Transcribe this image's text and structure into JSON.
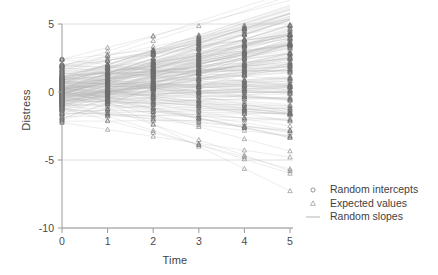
{
  "chart_data": {
    "type": "line",
    "title": "",
    "xlabel": "Time",
    "ylabel": "Distress",
    "xlim": [
      0,
      5
    ],
    "ylim": [
      -10,
      5
    ],
    "x": [
      0,
      1,
      2,
      3,
      4,
      5
    ],
    "xticks": [
      "0",
      "1",
      "2",
      "3",
      "4",
      "5"
    ],
    "yticks": [
      "5",
      "0",
      "-5",
      "-10"
    ],
    "ytick_values": [
      5,
      0,
      -5,
      -10
    ],
    "grid": "horizontal",
    "legend_position": "right",
    "legend": [
      {
        "label": "Random intercepts",
        "marker": "circle-marker"
      },
      {
        "label": "Expected values",
        "marker": "triangle-marker"
      },
      {
        "label": "Random slopes",
        "marker": "line-marker"
      }
    ],
    "n_subjects": 180,
    "series_notes": {
      "intercept_mean": 0.15,
      "intercept_sd": 0.95,
      "intercept_range": [
        -2.4,
        2.4
      ],
      "slope_mean": 0.3,
      "slope_sd": 0.62,
      "slope_range": [
        -1.7,
        1.1
      ],
      "value_range_at_time0": [
        -2.4,
        2.4
      ],
      "value_range_at_time5": [
        -8.6,
        5.3
      ]
    },
    "colors": {
      "line": "#b4b4b4",
      "marker": "#6e6e6e",
      "axis": "#9a9a9a",
      "grid": "#d8d8d8",
      "text": "#3f3f3f",
      "background": "#ffffff"
    },
    "series": [
      {
        "name": "Random intercepts",
        "marker": "circle",
        "x": [
          0
        ],
        "summary": "open circles at Time 0 spanning -2.4 to 2.4"
      },
      {
        "name": "Expected values",
        "marker": "triangle",
        "x": [
          0,
          1,
          2,
          3,
          4,
          5
        ],
        "summary": "open triangles at each time point; spread widens from +/-2.4 at Time 0 to -8.6..5.3 at Time 5"
      },
      {
        "name": "Random slopes",
        "marker": "line",
        "summary": "one faint grey straight line per subject connecting intercept to expected values"
      }
    ]
  },
  "plot_geometry": {
    "left": 62,
    "right": 290,
    "top": 24,
    "bottom": 228
  }
}
